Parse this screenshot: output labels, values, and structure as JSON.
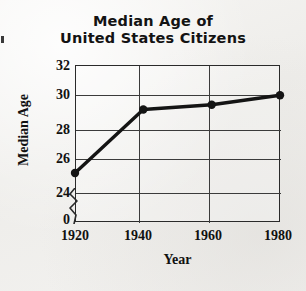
{
  "chart_data": {
    "type": "line",
    "title": "Median Age of United States Citizens",
    "title_line1": "Median Age of",
    "title_line2": "United States Citizens",
    "xlabel": "Year",
    "ylabel": "Median Age",
    "x": [
      1920,
      1940,
      1960,
      1980
    ],
    "categories": [
      "1920",
      "1940",
      "1960",
      "1980"
    ],
    "values": [
      25.2,
      29.2,
      29.5,
      30.1
    ],
    "series": [
      {
        "name": "Median Age",
        "values": [
          25.2,
          29.2,
          29.5,
          30.1
        ]
      }
    ],
    "xlim": [
      1920,
      1980
    ],
    "ylim": [
      24,
      32
    ],
    "y_axis_broken": true,
    "y_break_label": "0",
    "yticks": [
      32,
      30,
      28,
      26,
      24
    ],
    "ytick_labels": [
      "32",
      "30",
      "28",
      "26",
      "24",
      "0"
    ],
    "xticks": [
      1920,
      1940,
      1960,
      1980
    ],
    "xtick_labels": [
      "1920",
      "1940",
      "1960",
      "1980"
    ],
    "grid": true,
    "legend": null,
    "marker": "filled-circle",
    "line_color": "#141414",
    "grid_color": "#3b3b3b",
    "background_color": "#f2f1ef"
  },
  "axis": {
    "y_labels": [
      {
        "text": "32",
        "top": 58
      },
      {
        "text": "30",
        "top": 87
      },
      {
        "text": "28",
        "top": 122
      },
      {
        "text": "26",
        "top": 151
      },
      {
        "text": "24",
        "top": 185
      },
      {
        "text": "0",
        "top": 213
      }
    ],
    "x_labels": [
      {
        "text": "1920",
        "left": 45
      },
      {
        "text": "1940",
        "left": 108
      },
      {
        "text": "1960",
        "left": 178
      },
      {
        "text": "1980",
        "left": 248
      }
    ]
  }
}
